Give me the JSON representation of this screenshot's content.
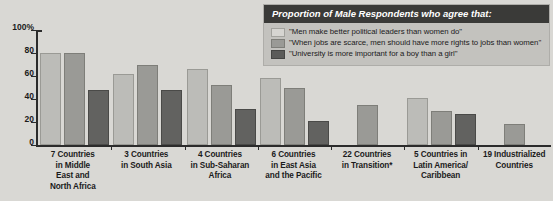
{
  "legend": {
    "title": "Proportion of Male Respondents who agree that:",
    "items": [
      {
        "label": "\"Men make better political leaders than women do\"",
        "swatch": "light-gray"
      },
      {
        "label": "\"When jobs are scarce, men should have more rights to jobs than women\"",
        "swatch": "medium-gray"
      },
      {
        "label": "\"University is more important for a boy than a girl\"",
        "swatch": "dark-gray"
      }
    ]
  },
  "chart_data": {
    "type": "bar",
    "title": "Proportion of Male Respondents who agree that:",
    "xlabel": "",
    "ylabel": "",
    "ylim": [
      0,
      100
    ],
    "yticks": [
      "0",
      "20",
      "40",
      "60",
      "80",
      "100%"
    ],
    "grid": false,
    "legend_position": "top-right",
    "categories": [
      "7 Countries in Middle East and North Africa",
      "3 Countries in South Asia",
      "4 Countries in Sub-Saharan Africa",
      "6 Countries in East Asia and the Pacific",
      "22 Countries in Transition*",
      "5 Countries in Latin America/ Caribbean",
      "19 Industrialized Countries"
    ],
    "series": [
      {
        "name": "\"Men make better political leaders than women do\"",
        "values": [
          80,
          62,
          66,
          58,
          null,
          41,
          null
        ]
      },
      {
        "name": "\"When jobs are scarce, men should have more rights to jobs than women\"",
        "values": [
          80,
          70,
          52,
          50,
          35,
          30,
          18
        ]
      },
      {
        "name": "\"University is more important for a boy than a girl\"",
        "values": [
          48,
          48,
          31,
          21,
          null,
          27,
          null
        ]
      }
    ]
  },
  "axis": {
    "ticks": [
      {
        "label": "100%",
        "value": 100
      },
      {
        "label": "80",
        "value": 80
      },
      {
        "label": "60",
        "value": 60
      },
      {
        "label": "40",
        "value": 40
      },
      {
        "label": "20",
        "value": 20
      },
      {
        "label": "0",
        "value": 0
      }
    ]
  },
  "xlabels": [
    {
      "lines": [
        "7 Countries",
        "in Middle",
        "East and",
        "North Africa"
      ]
    },
    {
      "lines": [
        "3 Countries",
        "in South Asia"
      ]
    },
    {
      "lines": [
        "4 Countries",
        "in Sub-Saharan",
        "Africa"
      ]
    },
    {
      "lines": [
        "6 Countries",
        "in East Asia",
        "and the Pacific"
      ]
    },
    {
      "lines": [
        "22 Countries",
        "in Transition*"
      ]
    },
    {
      "lines": [
        "5 Countries in",
        "Latin America/",
        "Caribbean"
      ]
    },
    {
      "lines": [
        "19 Industrialized",
        "Countries"
      ]
    }
  ]
}
